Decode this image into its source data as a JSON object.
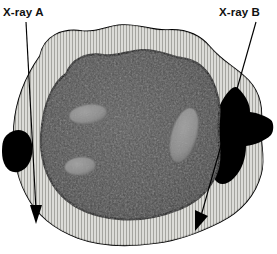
{
  "figure": {
    "kind": "anatomical-cross-section-diagram",
    "background_color": "#ffffff"
  },
  "labels": {
    "xray_a": "X-ray A",
    "xray_b": "X-ray B"
  },
  "colors": {
    "outline": "#000000",
    "cortex_band": "#d8d8d4",
    "cortex_striations": "#8e8e8a",
    "medulla": "#4e4e4e",
    "medulla_shadow": "#3c3c3c",
    "lesion_dark": "#000000",
    "cavity_light": "#8d8d8d",
    "cavity_light_edge": "#6a6a6a",
    "arrow": "#000000",
    "text": "#111111"
  },
  "annotations": [
    {
      "id": "xray-a",
      "label": "X-ray A",
      "label_x": 3,
      "label_y": 7,
      "line_start_x": 26,
      "line_start_y": 22,
      "line_end_x": 36,
      "line_end_y": 212,
      "arrow_tip_x": 36,
      "arrow_tip_y": 222,
      "passes_through": "cortex only, lateral to the dark lesion"
    },
    {
      "id": "xray-b",
      "label": "X-ray B",
      "label_x": 219,
      "label_y": 7,
      "line_start_x": 255,
      "line_start_y": 22,
      "line_end_x": 200,
      "line_end_y": 218,
      "arrow_tip_x": 195,
      "arrow_tip_y": 229,
      "passes_through": "large dark lytic lesion at the right cortex"
    }
  ],
  "structures": {
    "outer_cortex": {
      "name": "outer cortical shell",
      "fill": "#d8d8d4",
      "stroke": "#000000",
      "texture": "fine radial striations"
    },
    "inner_medulla": {
      "name": "medullary cavity",
      "fill": "#4e4e4e",
      "stroke": "#000000",
      "texture": "mottled granular"
    },
    "lesions": [
      {
        "id": "lesion-left",
        "name": "small dark lesion",
        "fill": "#000000",
        "cx": 18,
        "cy": 148,
        "rx": 13,
        "ry": 20
      },
      {
        "id": "lesion-right",
        "name": "large dark lesion crossing the cortex",
        "fill": "#000000",
        "cx": 232,
        "cy": 130,
        "rx": 33,
        "ry": 45
      }
    ],
    "cavities": [
      {
        "id": "cavity-upper-left",
        "name": "light oval cavity",
        "fill": "#8d8d8d",
        "cx": 88,
        "cy": 114,
        "rx": 18,
        "ry": 9,
        "rotation": -8
      },
      {
        "id": "cavity-lower-left",
        "name": "light oval cavity",
        "fill": "#8d8d8d",
        "cx": 80,
        "cy": 166,
        "rx": 15,
        "ry": 9,
        "rotation": -6
      },
      {
        "id": "cavity-right",
        "name": "large tilted light oval cavity",
        "fill": "#8d8d8d",
        "cx": 184,
        "cy": 135,
        "rx": 12,
        "ry": 28,
        "rotation": 16
      }
    ]
  }
}
